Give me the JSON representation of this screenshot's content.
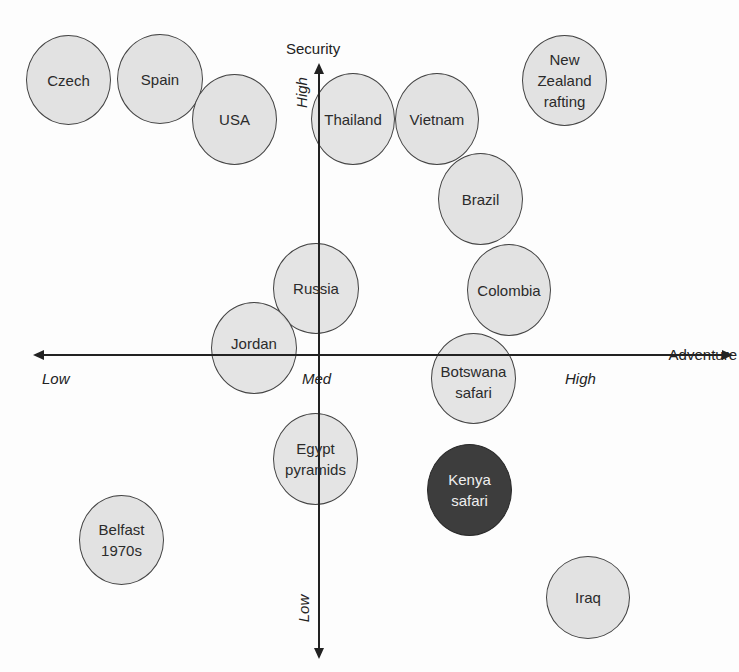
{
  "diagram": {
    "x_axis": {
      "name": "Adventure",
      "ticks": {
        "low": "Low",
        "med": "Med",
        "high": "High"
      }
    },
    "y_axis": {
      "name": "Security",
      "ticks": {
        "high": "High",
        "low": "Low"
      }
    },
    "colors": {
      "bubble_fill": "#e2e2e2",
      "bubble_border": "#444444",
      "highlight_fill": "#3d3d3d",
      "highlight_text": "#efefef",
      "axis": "#222222"
    },
    "bubbles": [
      {
        "label": "Czech",
        "cx": 68,
        "cy": 78,
        "highlight": false
      },
      {
        "label": "Spain",
        "cx": 160,
        "cy": 78,
        "highlight": false
      },
      {
        "label": "USA",
        "cx": 234,
        "cy": 119,
        "highlight": false
      },
      {
        "label": "Thailand",
        "cx": 352,
        "cy": 119,
        "highlight": false
      },
      {
        "label": "Vietnam",
        "cx": 437,
        "cy": 119,
        "highlight": false
      },
      {
        "label": "New\nZealand\nrafting",
        "cx": 564,
        "cy": 80,
        "highlight": false
      },
      {
        "label": "Brazil",
        "cx": 480,
        "cy": 199,
        "highlight": false
      },
      {
        "label": "Russia",
        "cx": 316,
        "cy": 288,
        "highlight": false
      },
      {
        "label": "Colombia",
        "cx": 509,
        "cy": 290,
        "highlight": false
      },
      {
        "label": "Jordan",
        "cx": 253,
        "cy": 348,
        "highlight": false
      },
      {
        "label": "Botswana\nsafari",
        "cx": 473,
        "cy": 378,
        "highlight": false
      },
      {
        "label": "Egypt\npyramids",
        "cx": 315,
        "cy": 459,
        "highlight": false
      },
      {
        "label": "Kenya\nsafari",
        "cx": 469,
        "cy": 489,
        "highlight": true
      },
      {
        "label": "Belfast\n1970s",
        "cx": 121,
        "cy": 540,
        "highlight": false
      },
      {
        "label": "Iraq",
        "cx": 589,
        "cy": 596,
        "highlight": false
      }
    ]
  }
}
